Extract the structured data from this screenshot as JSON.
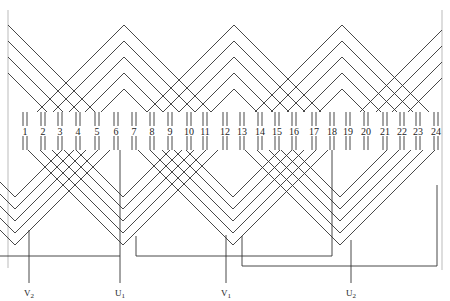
{
  "diagram": {
    "type": "three-phase stator winding diagram",
    "slot_count": 24,
    "slots": [
      {
        "label": "1",
        "x": 25
      },
      {
        "label": "2",
        "x": 43
      },
      {
        "label": "3",
        "x": 60
      },
      {
        "label": "4",
        "x": 78
      },
      {
        "label": "5",
        "x": 97
      },
      {
        "label": "6",
        "x": 116
      },
      {
        "label": "7",
        "x": 134
      },
      {
        "label": "8",
        "x": 152
      },
      {
        "label": "9",
        "x": 170
      },
      {
        "label": "10",
        "x": 189
      },
      {
        "label": "11",
        "x": 205
      },
      {
        "label": "12",
        "x": 225
      },
      {
        "label": "13",
        "x": 242
      },
      {
        "label": "14",
        "x": 260
      },
      {
        "label": "15",
        "x": 277
      },
      {
        "label": "16",
        "x": 294
      },
      {
        "label": "17",
        "x": 314
      },
      {
        "label": "18",
        "x": 332
      },
      {
        "label": "19",
        "x": 348
      },
      {
        "label": "20",
        "x": 366
      },
      {
        "label": "21",
        "x": 385
      },
      {
        "label": "22",
        "x": 402
      },
      {
        "label": "23",
        "x": 418
      },
      {
        "label": "24",
        "x": 436
      }
    ],
    "leads": [
      {
        "label": "V",
        "sub": "2",
        "x": 29
      },
      {
        "label": "U",
        "sub": "1",
        "x": 120
      },
      {
        "label": "V",
        "sub": "1",
        "x": 226
      },
      {
        "label": "U",
        "sub": "2",
        "x": 351
      }
    ],
    "colors": {
      "line": "#333333",
      "text": "#222222",
      "background": "#ffffff"
    }
  }
}
